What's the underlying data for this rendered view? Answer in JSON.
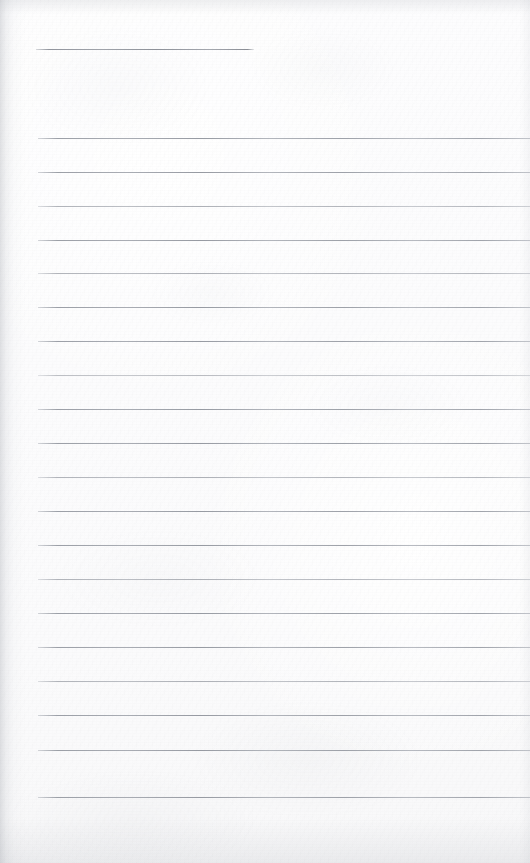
{
  "document": {
    "kind": "scanned-lined-page",
    "description": "Blank ruled notebook page, scanned",
    "page_width": 530,
    "page_height": 863,
    "paper_color": "#fdfdfd",
    "rule_color": "#9a9ea6",
    "text_content": "",
    "visible_text": []
  },
  "header_rule": {
    "label": "header-rule",
    "x": 36,
    "y": 49,
    "width": 218,
    "tone": "dark"
  },
  "rules": [
    {
      "y": 138,
      "x": 38,
      "width": 492,
      "tone": "dark"
    },
    {
      "y": 172,
      "x": 38,
      "width": 492,
      "tone": "dark"
    },
    {
      "y": 206,
      "x": 38,
      "width": 492,
      "tone": "pale"
    },
    {
      "y": 240,
      "x": 38,
      "width": 492,
      "tone": "dark"
    },
    {
      "y": 273,
      "x": 38,
      "width": 492,
      "tone": "pale"
    },
    {
      "y": 307,
      "x": 38,
      "width": 492,
      "tone": "dark"
    },
    {
      "y": 341,
      "x": 38,
      "width": 492,
      "tone": "dark"
    },
    {
      "y": 375,
      "x": 38,
      "width": 492,
      "tone": "paler"
    },
    {
      "y": 409,
      "x": 38,
      "width": 492,
      "tone": "dark"
    },
    {
      "y": 443,
      "x": 38,
      "width": 492,
      "tone": "dark"
    },
    {
      "y": 477,
      "x": 38,
      "width": 492,
      "tone": "pale"
    },
    {
      "y": 511,
      "x": 38,
      "width": 492,
      "tone": "dark"
    },
    {
      "y": 545,
      "x": 38,
      "width": 492,
      "tone": "dark"
    },
    {
      "y": 579,
      "x": 38,
      "width": 492,
      "tone": "pale"
    },
    {
      "y": 613,
      "x": 38,
      "width": 492,
      "tone": "dark"
    },
    {
      "y": 647,
      "x": 38,
      "width": 492,
      "tone": "dark"
    },
    {
      "y": 681,
      "x": 38,
      "width": 492,
      "tone": "pale"
    },
    {
      "y": 715,
      "x": 38,
      "width": 492,
      "tone": "dark"
    },
    {
      "y": 750,
      "x": 38,
      "width": 492,
      "tone": "dark"
    },
    {
      "y": 797,
      "x": 38,
      "width": 492,
      "tone": "dark"
    }
  ]
}
